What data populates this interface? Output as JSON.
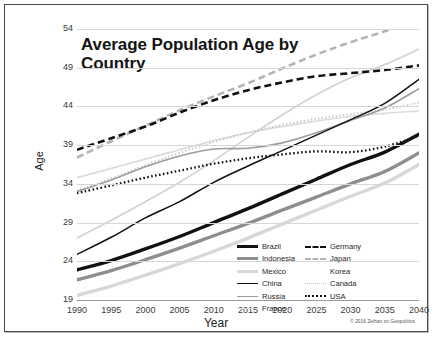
{
  "chart_data": {
    "type": "line",
    "title": "Average Population Age by Country",
    "xlabel": "Year",
    "ylabel": "Age",
    "x": [
      1990,
      1995,
      2000,
      2005,
      2010,
      2015,
      2020,
      2025,
      2030,
      2035,
      2040
    ],
    "xlim": [
      1990,
      2040
    ],
    "ylim": [
      19,
      54
    ],
    "yticks": [
      19,
      24,
      29,
      34,
      39,
      44,
      49,
      54
    ],
    "xticks": [
      "1990",
      "1995",
      "2000",
      "2005",
      "2010",
      "2015",
      "2020",
      "2025",
      "2030",
      "2035",
      "2040"
    ],
    "grid": true,
    "legend_position": "lower-right",
    "credit": "© 2016 Zeihan on Geopolitics",
    "series": [
      {
        "name": "Brazil",
        "color": "#111111",
        "width": 3.4,
        "dash": "none",
        "values": [
          22.9,
          24.1,
          25.6,
          27.2,
          29.0,
          30.8,
          32.7,
          34.6,
          36.5,
          38.1,
          40.4
        ]
      },
      {
        "name": "Indonesia",
        "color": "#8e8e8e",
        "width": 3.4,
        "dash": "none",
        "values": [
          21.6,
          22.8,
          24.2,
          25.7,
          27.3,
          28.9,
          30.6,
          32.3,
          34.0,
          35.6,
          38.0
        ]
      },
      {
        "name": "Mexico",
        "color": "#d8d8d8",
        "width": 3.4,
        "dash": "none",
        "values": [
          19.6,
          20.8,
          22.2,
          23.7,
          25.3,
          27.0,
          28.8,
          30.6,
          32.4,
          34.1,
          36.5
        ]
      },
      {
        "name": "China",
        "color": "#111111",
        "width": 1.5,
        "dash": "none",
        "values": [
          24.9,
          27.1,
          29.6,
          31.7,
          34.2,
          36.3,
          38.3,
          40.3,
          42.3,
          44.4,
          47.5
        ]
      },
      {
        "name": "Russia",
        "color": "#9d9d9d",
        "width": 1.7,
        "dash": "none",
        "values": [
          33.0,
          34.5,
          36.2,
          37.6,
          38.5,
          38.6,
          39.3,
          40.6,
          42.2,
          43.8,
          46.3
        ]
      },
      {
        "name": "France",
        "color": "#dcdcdc",
        "width": 1.7,
        "dash": "none",
        "values": [
          34.8,
          36.0,
          37.2,
          38.4,
          39.6,
          40.6,
          41.4,
          42.1,
          42.7,
          43.1,
          43.4
        ]
      },
      {
        "name": "Germany",
        "color": "#111111",
        "width": 2.6,
        "dash": "7,4",
        "values": [
          38.4,
          39.9,
          41.4,
          43.2,
          44.8,
          46.1,
          47.1,
          47.9,
          48.3,
          48.7,
          49.3
        ]
      },
      {
        "name": "Japan",
        "color": "#b4b4b4",
        "width": 2.6,
        "dash": "7,4",
        "values": [
          37.4,
          39.5,
          41.5,
          43.5,
          45.3,
          47.0,
          48.9,
          50.7,
          52.3,
          53.7,
          55.2
        ]
      },
      {
        "name": "Korea",
        "color": "#d2d2d2",
        "width": 1.7,
        "dash": "none",
        "values": [
          27.0,
          29.3,
          31.7,
          34.2,
          37.0,
          40.0,
          42.9,
          45.5,
          47.7,
          49.4,
          51.4
        ]
      },
      {
        "name": "Canada",
        "color": "#c6c6c6",
        "width": 1.9,
        "dash": "1.4,2.2",
        "values": [
          33.1,
          34.7,
          36.4,
          38.0,
          39.4,
          40.6,
          41.6,
          42.4,
          43.0,
          43.6,
          44.5
        ]
      },
      {
        "name": "USA",
        "color": "#111111",
        "width": 2.3,
        "dash": "1.6,2.4",
        "values": [
          32.8,
          33.8,
          34.8,
          35.7,
          36.6,
          37.3,
          37.8,
          38.2,
          38.1,
          38.8,
          40.2
        ]
      }
    ]
  },
  "legend": {
    "column_left": [
      "Brazil",
      "Indonesia",
      "Mexico",
      "China",
      "Russia",
      "France"
    ],
    "column_right": [
      "Germany",
      "Japan",
      "Korea",
      "Canada",
      "USA"
    ]
  }
}
